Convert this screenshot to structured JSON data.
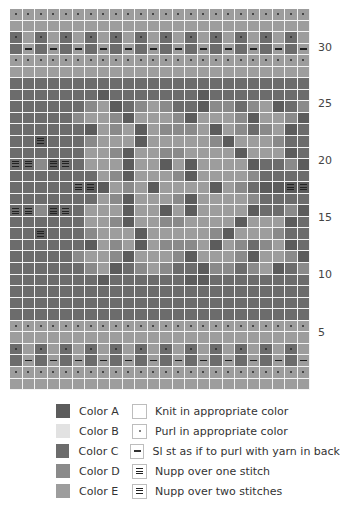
{
  "chart": {
    "columns": 24,
    "rows": 33,
    "row_labels": [
      {
        "label": "30",
        "row": 30
      },
      {
        "label": "25",
        "row": 25
      },
      {
        "label": "20",
        "row": 20
      },
      {
        "label": "15",
        "row": 15
      },
      {
        "label": "10",
        "row": 10
      },
      {
        "label": "5",
        "row": 5
      }
    ],
    "color_codes": {
      "a": "#5c5c5c",
      "b": "#e2e2e2",
      "c": "#6c6c6c",
      "d": "#8a8a8a",
      "e": "#9d9d9d"
    },
    "grid_top_to_bottom": [
      {
        "row": 33,
        "colors": "eeeeeeeeeeeeeeeeeeeeeeee",
        "symbols": "........................"
      },
      {
        "row": 32,
        "colors": "eeeeeeeeeeeeeeeeeeeeeeee",
        "symbols": "                        "
      },
      {
        "row": 31,
        "colors": "cecececececececececececece",
        "symbols": ". . . . . . . . . . . . "
      },
      {
        "row": 30,
        "colors": "cecececececececececececece",
        "symbols": " - - - - - - - - - - - -"
      },
      {
        "row": 29,
        "colors": "eeeeeeeeeeeeeeeeeeeeeeee",
        "symbols": "........................"
      },
      {
        "row": 28,
        "colors": "eeeeeeeeeeeeeeeeeeeeeeee",
        "symbols": "                        "
      },
      {
        "row": 27,
        "colors": "cccccccccccccccccccccccc",
        "symbols": "                        "
      },
      {
        "row": 26,
        "colors": "cccccccacccccccacccccccc",
        "symbols": "                        "
      },
      {
        "row": 25,
        "colors": "ccccccdeacdedccaddcdeacd",
        "symbols": "                        "
      },
      {
        "row": 24,
        "colors": "cccccdeedaeeedaeeedaeeda",
        "symbols": "                        "
      },
      {
        "row": 23,
        "colors": "ccccccaedeaedddeaedcdeac",
        "symbols": "                        "
      },
      {
        "row": 22,
        "colors": "ccacccdeeeaeeeeedaeeedcc",
        "symbols": "  =                     "
      },
      {
        "row": 21,
        "colors": "cccccceedaeeddeeeeaeeeac",
        "symbols": "                        "
      },
      {
        "row": 20,
        "colors": "ccdacceeeaeeaeaeeeeaccda",
        "symbols": "== ==                   "
      },
      {
        "row": 19,
        "colors": "cccccccedaeeedaeeeedcccc",
        "symbols": "                        "
      },
      {
        "row": 18,
        "colors": "ccccccaaedeaeeeeaedcaaaa",
        "symbols": "     ==               =="
      },
      {
        "row": 17,
        "colors": "cccccccedaeeedaeeeedcccc",
        "symbols": "                        "
      },
      {
        "row": 16,
        "colors": "ccdacceeeaeeaeaeeeeaccda",
        "symbols": "== ==                   "
      },
      {
        "row": 15,
        "colors": "cccccceedaeeddeeeeaeeeac",
        "symbols": "                        "
      },
      {
        "row": 14,
        "colors": "ccacccdeeeaeeeeedaeeedcc",
        "symbols": "  =                     "
      },
      {
        "row": 13,
        "colors": "ccccccaedeaedddeaedcdeac",
        "symbols": "                        "
      },
      {
        "row": 12,
        "colors": "cccccdeedaeeedaeeedaeeda",
        "symbols": "                        "
      },
      {
        "row": 11,
        "colors": "ccccccdeacdedccaddcdeacd",
        "symbols": "                        "
      },
      {
        "row": 10,
        "colors": "cccccccaccccccaacccccccc",
        "symbols": "                        "
      },
      {
        "row": 9,
        "colors": "cccccccccccccccccccccccc",
        "symbols": "                        "
      },
      {
        "row": 8,
        "colors": "cccccccccccccccccccccccc",
        "symbols": "                        "
      },
      {
        "row": 7,
        "colors": "cccccccccccccccccccccccc",
        "symbols": "                        "
      },
      {
        "row": 6,
        "colors": "eeeeeeeeeeeeeeeeeeeeeeee",
        "symbols": "........................"
      },
      {
        "row": 5,
        "colors": "eeeeeeeeeeeeeeeeeeeeeeee",
        "symbols": "                        "
      },
      {
        "row": 4,
        "colors": "cecececececececececececece",
        "symbols": ". . . . . . . . . . . . "
      },
      {
        "row": 3,
        "colors": "cecececececececececececece",
        "symbols": " - - - - - - - - - - - -"
      },
      {
        "row": 2,
        "colors": "eeeeeeeeeeeeeeeeeeeeeeee",
        "symbols": "........................"
      },
      {
        "row": 1,
        "colors": "eeeeeeeeeeeeeeeeeeeeeeee",
        "symbols": "                        "
      }
    ]
  },
  "legend": {
    "colors": [
      {
        "label": "Color A",
        "hex": "#5c5c5c"
      },
      {
        "label": "Color B",
        "hex": "#e2e2e2"
      },
      {
        "label": "Color C",
        "hex": "#6c6c6c"
      },
      {
        "label": "Color D",
        "hex": "#8a8a8a"
      },
      {
        "label": "Color E",
        "hex": "#9d9d9d"
      }
    ],
    "symbols": [
      {
        "symbol": "blank-icon",
        "label": "Knit in appropriate color"
      },
      {
        "symbol": "dot-icon",
        "label": "Purl in appropriate color"
      },
      {
        "symbol": "dash-icon",
        "label": "Sl st as if to purl with yarn in back"
      },
      {
        "symbol": "nupp-icon",
        "label": "Nupp over one stitch"
      },
      {
        "symbol": "nupp-icon",
        "label": "Nupp over two stitches"
      }
    ]
  }
}
